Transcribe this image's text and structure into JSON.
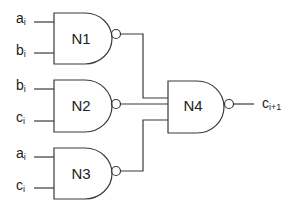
{
  "diagram": {
    "type": "logic-circuit",
    "gates": [
      {
        "id": "N1",
        "label": "N1",
        "kind": "NAND",
        "inputs": [
          {
            "base": "a",
            "sub": "i"
          },
          {
            "base": "b",
            "sub": "i"
          }
        ]
      },
      {
        "id": "N2",
        "label": "N2",
        "kind": "NAND",
        "inputs": [
          {
            "base": "b",
            "sub": "i"
          },
          {
            "base": "c",
            "sub": "i"
          }
        ]
      },
      {
        "id": "N3",
        "label": "N3",
        "kind": "NAND",
        "inputs": [
          {
            "base": "a",
            "sub": "i"
          },
          {
            "base": "c",
            "sub": "i"
          }
        ]
      },
      {
        "id": "N4",
        "label": "N4",
        "kind": "NAND",
        "inputs": [
          "N1",
          "N2",
          "N3"
        ]
      }
    ],
    "output": {
      "base": "c",
      "sub": "i+1"
    },
    "colors": {
      "line": "#3a3a3a",
      "text": "#222222",
      "background": "#ffffff"
    }
  }
}
